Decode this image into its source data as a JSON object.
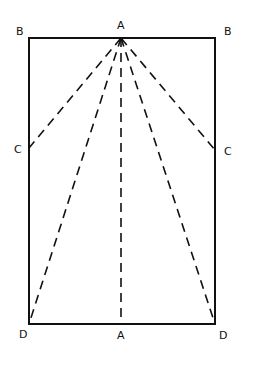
{
  "diagram": {
    "labels": {
      "top_left": "B",
      "top_right": "B",
      "top_center": "A",
      "mid_left": "C",
      "mid_right": "C",
      "bottom_left": "D",
      "bottom_right": "D",
      "bottom_center": "A"
    },
    "colors": {
      "line": "#111111",
      "background": "#ffffff"
    }
  }
}
